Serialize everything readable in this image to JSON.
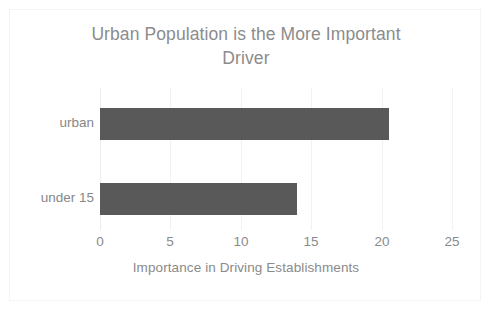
{
  "chart_data": {
    "type": "bar",
    "orientation": "horizontal",
    "title": "Urban Population is the More Important Driver",
    "title_line1": "Urban Population is the More Important",
    "title_line2": "Driver",
    "categories": [
      "urban",
      "under 15"
    ],
    "values": [
      20.5,
      14
    ],
    "xlabel": "Importance in Driving Establishments",
    "ylabel": "",
    "xlim": [
      0,
      25
    ],
    "xticks": [
      0,
      5,
      10,
      15,
      20,
      25
    ],
    "xtick_labels": [
      "0",
      "5",
      "10",
      "15",
      "20",
      "25"
    ],
    "grid": "vertical",
    "legend": "none",
    "series": [
      {
        "name": "Importance in Driving Establishments",
        "values": [
          20.5,
          14
        ]
      }
    ],
    "bar_color": "#595959",
    "text_color": "#8a8a8a",
    "gridline_color": "#f2f2f2",
    "background_color": "#ffffff"
  }
}
